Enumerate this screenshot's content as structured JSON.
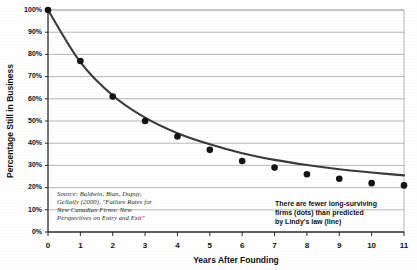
{
  "chart_data": {
    "type": "scatter",
    "title": "",
    "xlabel": "Years After Founding",
    "ylabel": "Percentage Still in Business",
    "xlim": [
      0,
      11
    ],
    "ylim": [
      0,
      100
    ],
    "grid": true,
    "legend_position": "none",
    "x": [
      0,
      1,
      2,
      3,
      4,
      5,
      6,
      7,
      8,
      9,
      10,
      11
    ],
    "xtick_labels": [
      "0",
      "1",
      "2",
      "3",
      "4",
      "5",
      "6",
      "7",
      "8",
      "9",
      "10",
      "11"
    ],
    "ytick_labels": [
      "0%",
      "10%",
      "20%",
      "30%",
      "40%",
      "50%",
      "60%",
      "70%",
      "80%",
      "90%",
      "100%"
    ],
    "ytick_values": [
      0,
      10,
      20,
      30,
      40,
      50,
      60,
      70,
      80,
      90,
      100
    ],
    "series": [
      {
        "name": "Firms still in business (observed)",
        "render": "dots",
        "values": [
          100,
          77,
          61,
          50,
          43,
          37,
          32,
          29,
          26,
          24,
          22,
          21
        ]
      },
      {
        "name": "Lindy's law (predicted)",
        "render": "line",
        "values": [
          100,
          76.5,
          61.5,
          51.5,
          44.5,
          39.5,
          35.5,
          32.5,
          30.2,
          28.3,
          26.8,
          25.5
        ]
      }
    ],
    "annotations": [
      {
        "name": "source-citation",
        "style": "italic-serif",
        "lines": [
          "Source: Baldwin, Bian, Dupuy,",
          "Gellatly (2000), \"Failure Rates for",
          "New Canadian Firms: New",
          "Perspectives on Entry and Exit\""
        ]
      },
      {
        "name": "lindy-callout",
        "style": "bold-sans",
        "lines": [
          "There are fewer long-surviving",
          "firms (dots) than predicted",
          "by Lindy's law (line)"
        ]
      }
    ],
    "colors": {
      "dot": "#141414",
      "line": "#3a3a3a",
      "grid": "#9a9a9a",
      "axis": "#2b2b2b",
      "background": "#ffffff"
    }
  }
}
